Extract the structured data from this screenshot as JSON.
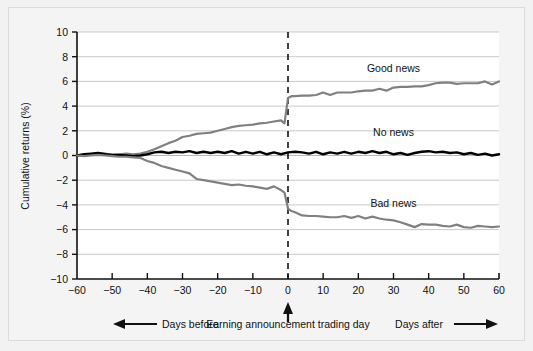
{
  "chart_data": {
    "type": "line",
    "title": "",
    "xlabel": "Earning announcement trading day",
    "ylabel": "Cumulative returns (%)",
    "xlim": [
      -60,
      60
    ],
    "ylim": [
      -10,
      10
    ],
    "xticks": [
      -60,
      -50,
      -40,
      -30,
      -20,
      -10,
      0,
      10,
      20,
      30,
      40,
      50,
      60
    ],
    "yticks": [
      -10,
      -8,
      -6,
      -4,
      -2,
      0,
      2,
      4,
      6,
      8,
      10
    ],
    "xtick_labels": [
      "−60",
      "−50",
      "−40",
      "−30",
      "−20",
      "−10",
      "0",
      "10",
      "20",
      "30",
      "40",
      "50",
      "60"
    ],
    "ytick_labels": [
      "−10",
      "−8",
      "−6",
      "−4",
      "−2",
      "0",
      "2",
      "4",
      "6",
      "8",
      "10"
    ],
    "grid": "horizontal",
    "legend_position": "inline-annotations",
    "event_line_x": 0,
    "event_line_style": "dashed",
    "annotations": [
      {
        "name": "days-before",
        "text": "Days before",
        "arrow": "left"
      },
      {
        "name": "event-axis-title",
        "text": "Earning announcement trading day",
        "arrow": "up"
      },
      {
        "name": "days-after",
        "text": "Days after",
        "arrow": "right"
      }
    ],
    "series": [
      {
        "name": "Good news",
        "label": "Good news",
        "color": "#808080",
        "label_x": 30,
        "label_y": 6.8,
        "x": [
          -60,
          -58,
          -56,
          -54,
          -52,
          -50,
          -48,
          -46,
          -44,
          -42,
          -40,
          -38,
          -36,
          -34,
          -32,
          -30,
          -28,
          -26,
          -24,
          -22,
          -20,
          -18,
          -16,
          -14,
          -12,
          -10,
          -8,
          -6,
          -4,
          -2,
          -1,
          0,
          1,
          2,
          4,
          6,
          8,
          10,
          12,
          14,
          16,
          18,
          20,
          22,
          24,
          26,
          28,
          30,
          32,
          34,
          36,
          38,
          40,
          42,
          44,
          46,
          48,
          50,
          52,
          54,
          56,
          58,
          60
        ],
        "y": [
          0.0,
          0.05,
          0.1,
          0.2,
          0.15,
          0.05,
          0.1,
          0.15,
          0.1,
          0.15,
          0.3,
          0.5,
          0.75,
          1.0,
          1.2,
          1.5,
          1.6,
          1.75,
          1.8,
          1.85,
          2.0,
          2.15,
          2.3,
          2.4,
          2.45,
          2.5,
          2.6,
          2.65,
          2.75,
          2.85,
          2.6,
          4.65,
          4.8,
          4.8,
          4.85,
          4.85,
          4.9,
          5.1,
          4.9,
          5.1,
          5.1,
          5.1,
          5.2,
          5.25,
          5.25,
          5.4,
          5.25,
          5.5,
          5.55,
          5.55,
          5.6,
          5.6,
          5.7,
          5.85,
          5.9,
          5.9,
          5.8,
          5.85,
          5.85,
          5.85,
          6.0,
          5.75,
          6.0
        ]
      },
      {
        "name": "No news",
        "label": "No news",
        "color": "#000000",
        "label_x": 30,
        "label_y": 1.6,
        "x": [
          -60,
          -58,
          -56,
          -54,
          -52,
          -50,
          -48,
          -46,
          -44,
          -42,
          -40,
          -38,
          -36,
          -34,
          -32,
          -30,
          -28,
          -26,
          -24,
          -22,
          -20,
          -18,
          -16,
          -14,
          -12,
          -10,
          -8,
          -6,
          -4,
          -2,
          0,
          2,
          4,
          6,
          8,
          10,
          12,
          14,
          16,
          18,
          20,
          22,
          24,
          26,
          28,
          30,
          32,
          34,
          36,
          38,
          40,
          42,
          44,
          46,
          48,
          50,
          52,
          54,
          56,
          58,
          60
        ],
        "y": [
          0.0,
          0.1,
          0.15,
          0.2,
          0.1,
          0.05,
          0.05,
          0.0,
          -0.05,
          0.0,
          0.1,
          0.25,
          0.3,
          0.2,
          0.3,
          0.25,
          0.35,
          0.2,
          0.3,
          0.2,
          0.3,
          0.2,
          0.35,
          0.15,
          0.3,
          0.15,
          0.3,
          0.1,
          0.25,
          0.1,
          0.25,
          0.3,
          0.25,
          0.15,
          0.3,
          0.1,
          0.25,
          0.15,
          0.3,
          0.15,
          0.3,
          0.2,
          0.35,
          0.2,
          0.3,
          0.1,
          0.2,
          0.05,
          0.2,
          0.3,
          0.35,
          0.25,
          0.3,
          0.2,
          0.25,
          0.1,
          0.2,
          0.05,
          0.15,
          0.0,
          0.1
        ]
      },
      {
        "name": "Bad news",
        "label": "Bad news",
        "color": "#808080",
        "label_x": 30,
        "label_y": -4.2,
        "x": [
          -60,
          -58,
          -56,
          -54,
          -52,
          -50,
          -48,
          -46,
          -44,
          -42,
          -40,
          -38,
          -36,
          -34,
          -32,
          -30,
          -28,
          -26,
          -24,
          -22,
          -20,
          -18,
          -16,
          -14,
          -12,
          -10,
          -8,
          -6,
          -4,
          -2,
          -1,
          0,
          1,
          2,
          4,
          6,
          8,
          10,
          12,
          14,
          16,
          18,
          20,
          22,
          24,
          26,
          28,
          30,
          32,
          34,
          36,
          38,
          40,
          42,
          44,
          46,
          48,
          50,
          52,
          54,
          56,
          58,
          60
        ],
        "y": [
          0.0,
          -0.05,
          0.0,
          0.05,
          0.0,
          -0.05,
          -0.1,
          -0.1,
          -0.15,
          -0.2,
          -0.45,
          -0.6,
          -0.85,
          -1.0,
          -1.15,
          -1.3,
          -1.45,
          -1.9,
          -2.0,
          -2.1,
          -2.2,
          -2.3,
          -2.4,
          -2.35,
          -2.45,
          -2.5,
          -2.6,
          -2.7,
          -2.5,
          -2.8,
          -3.0,
          -4.3,
          -4.5,
          -4.6,
          -4.85,
          -4.9,
          -4.9,
          -4.95,
          -5.0,
          -5.0,
          -4.9,
          -5.05,
          -4.9,
          -5.1,
          -4.95,
          -5.1,
          -5.2,
          -5.25,
          -5.4,
          -5.6,
          -5.8,
          -5.55,
          -5.6,
          -5.6,
          -5.7,
          -5.75,
          -5.6,
          -5.8,
          -5.85,
          -5.7,
          -5.75,
          -5.8,
          -5.75
        ]
      }
    ]
  }
}
